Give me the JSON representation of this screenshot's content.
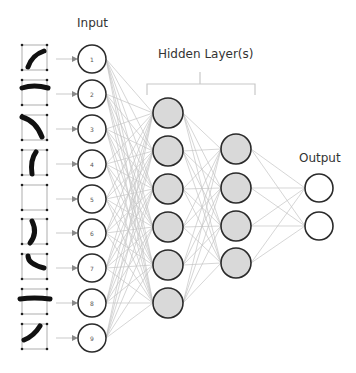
{
  "labels": {
    "input": "Input",
    "hidden": "Hidden Layer(s)",
    "output": "Output"
  },
  "colors": {
    "node_stroke": "#2a2a2a",
    "hidden_fill": "#d9d9d9",
    "input_fill": "#ffffff",
    "edge": "#c4c4c4",
    "glyph": "#111111",
    "grid": "#999999"
  },
  "layers": {
    "input": {
      "x": 92,
      "r": 14,
      "nodes": [
        {
          "label": "1",
          "y": 59,
          "glyph": "arc-lower-right"
        },
        {
          "label": "2",
          "y": 94,
          "glyph": "horizontal-bar"
        },
        {
          "label": "3",
          "y": 129,
          "glyph": "arc-upper-left"
        },
        {
          "label": "4",
          "y": 164,
          "glyph": "vertical-left-curve"
        },
        {
          "label": "5",
          "y": 199,
          "glyph": "empty"
        },
        {
          "label": "6",
          "y": 233,
          "glyph": "vertical-right-curve"
        },
        {
          "label": "7",
          "y": 268,
          "glyph": "arc-lower-left"
        },
        {
          "label": "8",
          "y": 303,
          "glyph": "horizontal-bar-thick"
        },
        {
          "label": "9",
          "y": 338,
          "glyph": "arc-upper-right"
        }
      ]
    },
    "hidden1": {
      "x": 168,
      "r": 15,
      "ys": [
        113,
        151,
        189,
        227,
        265,
        303
      ]
    },
    "hidden2": {
      "x": 236,
      "r": 15,
      "ys": [
        149,
        188,
        226,
        263
      ]
    },
    "output": {
      "x": 319,
      "r": 14,
      "ys": [
        188,
        226
      ]
    }
  }
}
